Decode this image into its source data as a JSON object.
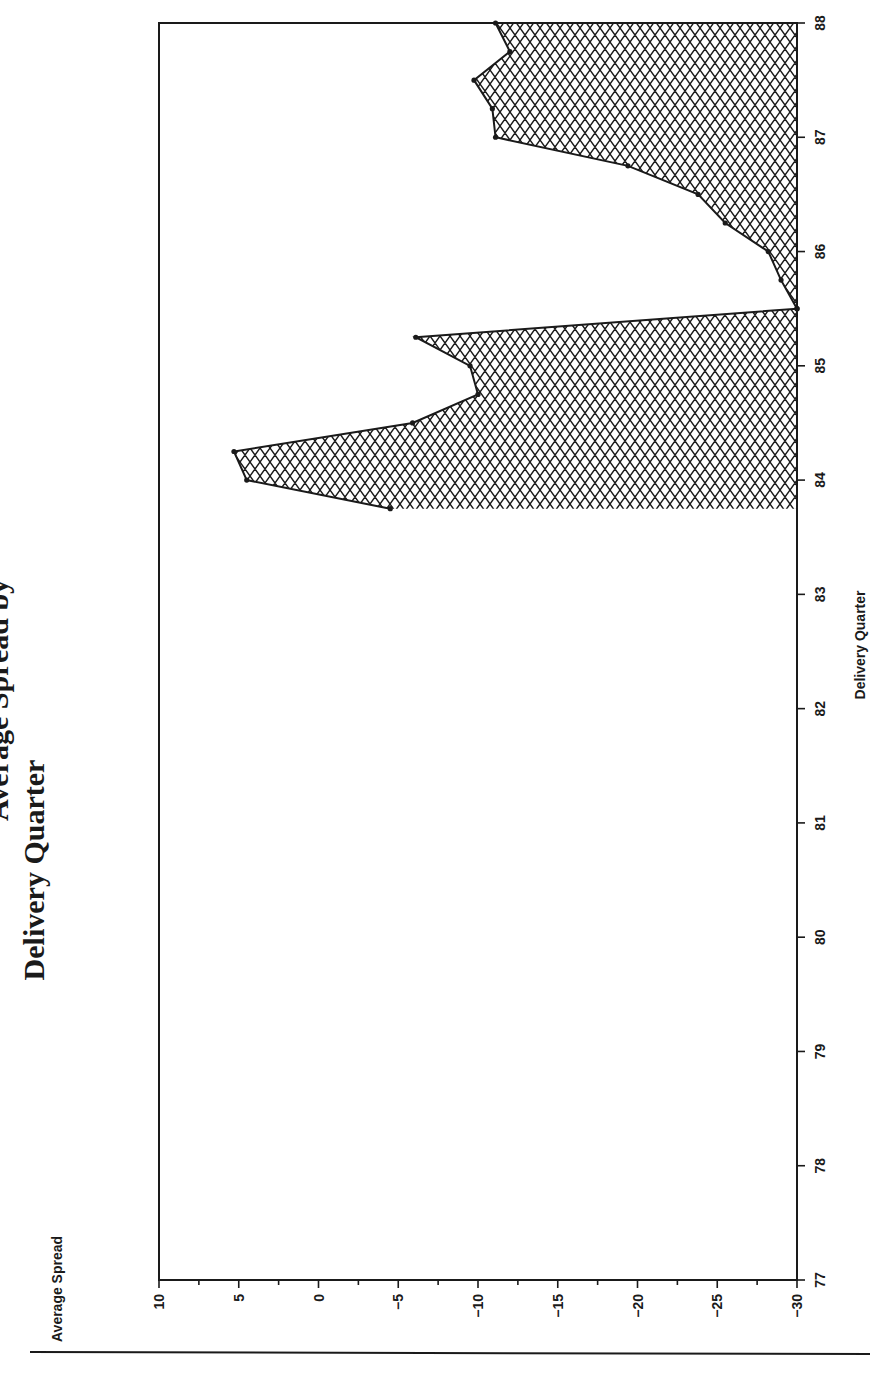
{
  "title": {
    "line1": "Average Spread by",
    "line2": "Delivery Quarter"
  },
  "chart_data": {
    "type": "area",
    "title": "Average Spread by Delivery Quarter",
    "xlabel": "Delivery Quarter",
    "ylabel": "Average Spread",
    "orientation": "rotated-90-ccw",
    "xlim": [
      77,
      88
    ],
    "ylim": [
      -30,
      10
    ],
    "x_ticks": [
      77,
      78,
      79,
      80,
      81,
      82,
      83,
      84,
      85,
      86,
      87,
      88
    ],
    "y_ticks": [
      10,
      5,
      0,
      -5,
      -10,
      -15,
      -20,
      -25,
      -30
    ],
    "y_minor_step": 2.5,
    "fill_baseline": -30,
    "fill_pattern": "crosshatch",
    "grid": false,
    "legend": null,
    "segments": [
      {
        "x": [
          83.75,
          84.0,
          84.25,
          84.5,
          84.75,
          85.0,
          85.25,
          85.5
        ],
        "y": [
          -4.5,
          4.5,
          5.3,
          -5.9,
          -10.0,
          -9.5,
          -6.1,
          -30.0
        ]
      },
      {
        "x": [
          85.5,
          85.75,
          86.0,
          86.25,
          86.5,
          86.75,
          87.0,
          87.25,
          87.5,
          87.75,
          88.0
        ],
        "y": [
          -30.0,
          -29.0,
          -28.2,
          -25.5,
          -23.8,
          -19.4,
          -11.1,
          -10.9,
          -9.75,
          -12.0,
          -11.1
        ]
      }
    ]
  },
  "colors": {
    "ink": "#1a1a1a",
    "background": "#ffffff"
  }
}
